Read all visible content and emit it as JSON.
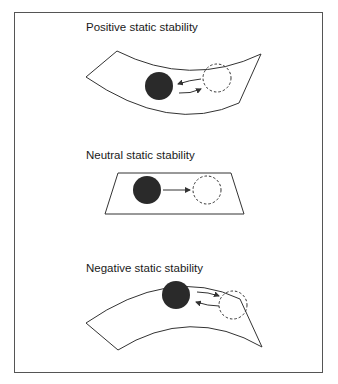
{
  "diagram": {
    "panels": [
      {
        "title": "Positive static stability",
        "surface": "concave",
        "motion": "returns-to-equilibrium"
      },
      {
        "title": "Neutral static stability",
        "surface": "flat",
        "motion": "remains-displaced"
      },
      {
        "title": "Negative static stability",
        "surface": "convex",
        "motion": "diverges-from-equilibrium"
      }
    ],
    "legend": {
      "solid_ball": "equilibrium position",
      "dashed_ball": "displaced position"
    },
    "colors": {
      "ball": "#2a2a2a",
      "line": "#333333",
      "background": "#ffffff"
    }
  }
}
